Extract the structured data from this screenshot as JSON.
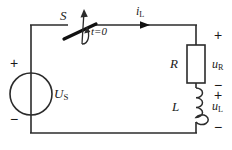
{
  "figure": {
    "type": "schematic",
    "width": 232,
    "height": 150,
    "stroke_color": "#2b2b2b",
    "background_color": "#ffffff"
  },
  "labels": {
    "switch_name": "S",
    "switch_time": "t=0",
    "current_symbol": "i",
    "current_subscript": "L",
    "source_symbol": "U",
    "source_subscript": "S",
    "resistor_symbol": "R",
    "resistor_voltage_symbol": "u",
    "resistor_voltage_subscript": "R",
    "inductor_symbol": "L",
    "inductor_voltage_symbol": "u",
    "inductor_voltage_subscript": "L",
    "plus": "+",
    "minus": "−"
  },
  "polarity": {
    "source_top": "+",
    "source_bottom": "−",
    "resistor_top": "+",
    "resistor_bottom": "−",
    "inductor_top": "+",
    "inductor_bottom": "−"
  },
  "components": [
    {
      "name": "voltage-source",
      "symbol": "U",
      "subscript": "S",
      "shape": "circle-with-bar"
    },
    {
      "name": "switch",
      "symbol": "S",
      "note": "t=0",
      "shape": "open-blade"
    },
    {
      "name": "resistor",
      "symbol": "R",
      "shape": "rectangle"
    },
    {
      "name": "inductor",
      "symbol": "L",
      "shape": "coil-4-turns"
    }
  ]
}
